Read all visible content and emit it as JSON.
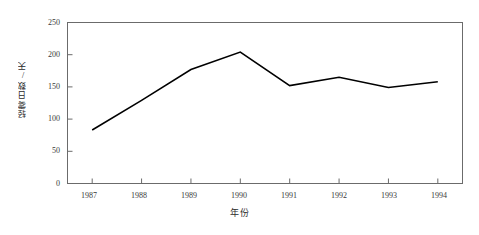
{
  "chart_data": {
    "type": "line",
    "title": "",
    "subtitle": "",
    "xlabel": "年份",
    "ylabel": "轻雾日数/天",
    "categories": [
      "1987",
      "1988",
      "1989",
      "1990",
      "1991",
      "1992",
      "1993",
      "1994"
    ],
    "x": [
      1987,
      1988,
      1989,
      1990,
      1991,
      1992,
      1993,
      1994
    ],
    "values": [
      83,
      129,
      177,
      204,
      152,
      165,
      149,
      158
    ],
    "series": [
      {
        "name": "轻雾日数",
        "values": [
          83,
          129,
          177,
          204,
          152,
          165,
          149,
          158
        ],
        "color": "#000000"
      }
    ],
    "xlim": [
      1986.5,
      1994.5
    ],
    "ylim": [
      0,
      250
    ],
    "yticks": [
      0,
      50,
      100,
      150,
      200,
      250
    ],
    "ytick_labels": [
      "0",
      "50",
      "100",
      "150",
      "200",
      "250"
    ],
    "xtick_labels": [
      "1987",
      "1988",
      "1989",
      "1990",
      "1991",
      "1992",
      "1993",
      "1994"
    ],
    "grid": false,
    "legend": false,
    "legend_position": "none",
    "markers": false,
    "frame": "box",
    "line_color": "#000000",
    "axis_color": "#6b6b6b",
    "background": "#ffffff"
  }
}
